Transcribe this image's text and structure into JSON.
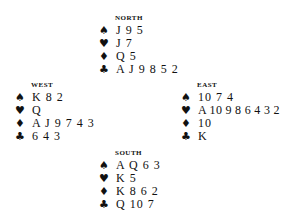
{
  "diagram": {
    "type": "bridge-deal",
    "suit_symbols": {
      "spades": "♠",
      "hearts": "♥",
      "diamonds": "♦",
      "clubs": "♣"
    },
    "hands": {
      "north": {
        "label": "NORTH",
        "spades": "J 9 5",
        "hearts": "J 7",
        "diamonds": "Q 5",
        "clubs": "A J 9 8 5 2"
      },
      "west": {
        "label": "WEST",
        "spades": "K 8 2",
        "hearts": "Q",
        "diamonds": "A J 9 7 4 3",
        "clubs": "6 4 3"
      },
      "east": {
        "label": "EAST",
        "spades": "10 7 4",
        "hearts": "A 10 9 8 6 4 3 2",
        "diamonds": "10",
        "clubs": "K"
      },
      "south": {
        "label": "SOUTH",
        "spades": "A Q 6 3",
        "hearts": "K 5",
        "diamonds": "K 8 6 2",
        "clubs": "Q 10 7"
      }
    }
  }
}
